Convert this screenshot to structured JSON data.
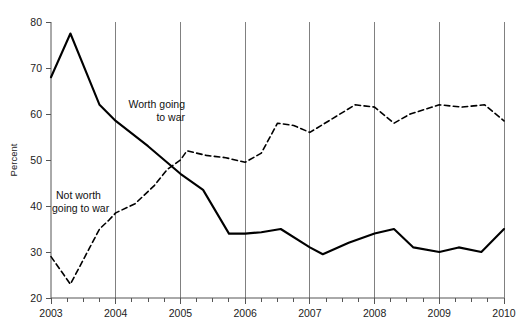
{
  "chart_data": {
    "type": "line",
    "title": "",
    "xlabel": "",
    "ylabel": "Percent",
    "xlim": [
      2003.0,
      2010.0
    ],
    "ylim": [
      20,
      80
    ],
    "yticks": [
      20,
      30,
      40,
      50,
      60,
      70,
      80
    ],
    "ytick_labels": [
      "20",
      "30",
      "40",
      "50",
      "60",
      "70",
      "80"
    ],
    "xticks": [
      2003,
      2004,
      2005,
      2006,
      2007,
      2008,
      2009,
      2010
    ],
    "xtick_labels": [
      "2003",
      "2004",
      "2005",
      "2006",
      "2007",
      "2008",
      "2009",
      "2010"
    ],
    "x_minor_tick_interval": 0.25,
    "grid": "vertical-only",
    "gridlines_x": [
      2004,
      2005,
      2006,
      2007,
      2008,
      2009,
      2010
    ],
    "grid_color": "#808080",
    "legend": "inline-annotations",
    "series": [
      {
        "name": "Worth going to war",
        "style": "solid",
        "color": "#000000",
        "label_position": {
          "x": 2004.1,
          "y": 61.5
        },
        "points": [
          {
            "x": 2003.0,
            "y": 68.0
          },
          {
            "x": 2003.3,
            "y": 77.5
          },
          {
            "x": 2003.75,
            "y": 62.0
          },
          {
            "x": 2004.0,
            "y": 58.5
          },
          {
            "x": 2004.5,
            "y": 53.0
          },
          {
            "x": 2005.0,
            "y": 47.0
          },
          {
            "x": 2005.35,
            "y": 43.5
          },
          {
            "x": 2005.75,
            "y": 34.0
          },
          {
            "x": 2006.0,
            "y": 34.0
          },
          {
            "x": 2006.25,
            "y": 34.3
          },
          {
            "x": 2006.55,
            "y": 35.0
          },
          {
            "x": 2007.0,
            "y": 31.0
          },
          {
            "x": 2007.2,
            "y": 29.5
          },
          {
            "x": 2007.6,
            "y": 32.0
          },
          {
            "x": 2008.0,
            "y": 34.0
          },
          {
            "x": 2008.3,
            "y": 35.0
          },
          {
            "x": 2008.6,
            "y": 31.0
          },
          {
            "x": 2009.0,
            "y": 30.0
          },
          {
            "x": 2009.3,
            "y": 31.0
          },
          {
            "x": 2009.65,
            "y": 30.0
          },
          {
            "x": 2010.0,
            "y": 35.0
          }
        ]
      },
      {
        "name": "Not worth going to war",
        "style": "dashed",
        "color": "#000000",
        "label_position": {
          "x": 2003.1,
          "y": 41.0
        },
        "points": [
          {
            "x": 2003.0,
            "y": 29.0
          },
          {
            "x": 2003.3,
            "y": 23.0
          },
          {
            "x": 2003.6,
            "y": 31.0
          },
          {
            "x": 2003.75,
            "y": 35.0
          },
          {
            "x": 2003.9,
            "y": 37.0
          },
          {
            "x": 2004.0,
            "y": 38.5
          },
          {
            "x": 2004.3,
            "y": 40.5
          },
          {
            "x": 2004.6,
            "y": 44.5
          },
          {
            "x": 2004.8,
            "y": 48.0
          },
          {
            "x": 2005.0,
            "y": 50.0
          },
          {
            "x": 2005.1,
            "y": 52.0
          },
          {
            "x": 2005.4,
            "y": 51.0
          },
          {
            "x": 2005.7,
            "y": 50.5
          },
          {
            "x": 2006.0,
            "y": 49.5
          },
          {
            "x": 2006.25,
            "y": 51.5
          },
          {
            "x": 2006.5,
            "y": 58.0
          },
          {
            "x": 2006.75,
            "y": 57.5
          },
          {
            "x": 2007.0,
            "y": 56.0
          },
          {
            "x": 2007.35,
            "y": 59.0
          },
          {
            "x": 2007.7,
            "y": 62.0
          },
          {
            "x": 2008.0,
            "y": 61.5
          },
          {
            "x": 2008.3,
            "y": 58.0
          },
          {
            "x": 2008.55,
            "y": 60.0
          },
          {
            "x": 2009.0,
            "y": 62.0
          },
          {
            "x": 2009.35,
            "y": 61.5
          },
          {
            "x": 2009.7,
            "y": 62.0
          },
          {
            "x": 2010.0,
            "y": 58.5
          }
        ]
      }
    ],
    "annotations": [
      {
        "text_line1": "Worth going",
        "text_line2": "to war"
      },
      {
        "text_line1": "Not worth",
        "text_line2": "going to war"
      }
    ]
  },
  "labels": {
    "y_axis_title": "Percent",
    "worth_line1": "Worth going",
    "worth_line2": "to war",
    "notworth_line1": "Not worth",
    "notworth_line2": "going to war"
  }
}
